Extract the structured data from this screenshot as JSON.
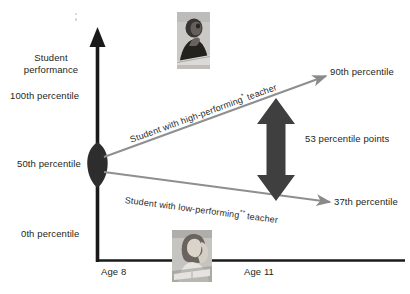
{
  "figure": {
    "type": "diagram",
    "kind": "teacher-effectiveness-growth-chart",
    "background_color": "#ffffff",
    "ink_color": "#231f20",
    "line_color": "#808080",
    "arrow_color": "#4a4a4a"
  },
  "axes": {
    "y_title_line1": "Student",
    "y_title_line2": "performance",
    "y_ticks": [
      {
        "label": "100th percentile",
        "value": 100
      },
      {
        "label": "50th percentile",
        "value": 50
      },
      {
        "label": "0th percentile",
        "value": 0
      }
    ],
    "x_ticks": [
      {
        "label": "Age 8",
        "value": 8
      },
      {
        "label": "Age 11",
        "value": 11
      }
    ]
  },
  "trajectories": [
    {
      "id": "high-performing",
      "label_prefix": "Student with high-performing",
      "label_marker": "*",
      "label_suffix": " teacher",
      "start_percentile": 50,
      "end_percentile": 90,
      "end_label": "90th percentile"
    },
    {
      "id": "low-performing",
      "label_prefix": "Student with low-performing",
      "label_marker": "**",
      "label_suffix": " teacher",
      "start_percentile": 50,
      "end_percentile": 37,
      "end_label": "37th percentile"
    }
  ],
  "gap_annotation": {
    "label": "53 percentile points",
    "value": 53,
    "unit": "percentile points",
    "arrow": "double-headed-vertical"
  },
  "photos": [
    {
      "id": "photo-top",
      "caption": "boy-studying-photo",
      "alt": "young student working at a desk"
    },
    {
      "id": "photo-bottom",
      "caption": "girl-frustrated-photo",
      "alt": "student with hand on head at a desk"
    }
  ],
  "icons": {
    "y_axis_arrow": "arrow-up-icon",
    "gap_arrow": "arrow-up-down-icon",
    "origin_marker": "ellipse-marker-icon",
    "line_arrow": "arrow-right-icon"
  }
}
